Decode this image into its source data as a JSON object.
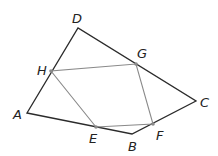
{
  "figure": {
    "outer_quad": {
      "vertices": [
        "A",
        "B",
        "C",
        "D"
      ],
      "color": "#2b2b2b"
    },
    "inner_quad": {
      "vertices": [
        "E",
        "F",
        "G",
        "H"
      ],
      "color": "#8a8a8a"
    },
    "points": {
      "A": {
        "label": "A",
        "x": 27,
        "y": 113,
        "lx": 13,
        "ly": 119
      },
      "B": {
        "label": "B",
        "x": 132,
        "y": 134,
        "lx": 128,
        "ly": 151
      },
      "C": {
        "label": "C",
        "x": 196,
        "y": 101,
        "lx": 200,
        "ly": 107
      },
      "D": {
        "label": "D",
        "x": 78,
        "y": 28,
        "lx": 72,
        "ly": 23
      },
      "E": {
        "label": "E",
        "x": 96,
        "y": 127,
        "lx": 89,
        "ly": 143
      },
      "F": {
        "label": "F",
        "x": 153,
        "y": 124,
        "lx": 156,
        "ly": 140
      },
      "G": {
        "label": "G",
        "x": 136,
        "y": 64,
        "lx": 137,
        "ly": 58
      },
      "H": {
        "label": "H",
        "x": 51,
        "y": 71,
        "lx": 37,
        "ly": 75
      }
    }
  }
}
